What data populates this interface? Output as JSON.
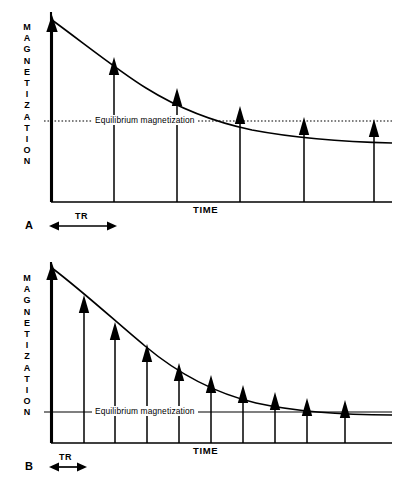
{
  "figure": {
    "panels": [
      {
        "id": "A",
        "letter": "B-wrong-placeholder",
        "axis_y_label": "MAGNETIZATION",
        "axis_x_label": "TIME",
        "equilibrium_label": "Equilibrium  magnetization",
        "tr_label": "TR"
      }
    ]
  },
  "panel_a": {
    "letter": "A",
    "axis_y_label": "MAGNETIZATION",
    "axis_x_label": "TIME",
    "equilibrium_label": "Equilibrium  magnetization",
    "tr_label": "TR"
  },
  "panel_b": {
    "letter": "B",
    "axis_y_label": "MAGNETIZATION",
    "axis_x_label": "TIME",
    "equilibrium_label": "Equilibrium  magnetization",
    "tr_label": "TR"
  },
  "colors": {
    "ink": "#000000",
    "background": "#ffffff",
    "curve": "#000000",
    "equilibrium_line": "#000000"
  },
  "chart_data": [
    {
      "type": "line",
      "panel": "A",
      "title": "",
      "xlabel": "TIME",
      "ylabel": "MAGNETIZATION",
      "xlim": [
        0,
        340
      ],
      "ylim": [
        0,
        182
      ],
      "grid": false,
      "legend": null,
      "annotations": [
        {
          "text": "Equilibrium  magnetization",
          "y": 81,
          "kind": "horizontal-dotted-line"
        },
        {
          "text": "TR",
          "kind": "interval-double-arrow",
          "x_start": 0,
          "x_end": 63
        },
        {
          "text": "A",
          "kind": "panel-letter"
        }
      ],
      "curve": {
        "name": "T1 recovery envelope (long TR)",
        "equation": "M(t) = Meq + (M0 - Meq) * exp(-t / tau)",
        "M0": 182,
        "Meq": 81,
        "tau": 118,
        "x": [
          0,
          20,
          40,
          63,
          85,
          110,
          127,
          150,
          175,
          190,
          220,
          253,
          285,
          317,
          340
        ],
        "y": [
          182,
          167,
          153,
          141,
          130,
          120,
          115,
          108,
          102,
          99,
          94,
          90,
          87,
          85,
          84
        ]
      },
      "pulse_arrows": {
        "name": "Excitation pulses (arrow tips on recovery curve)",
        "count": 6,
        "spacing_tr": 63,
        "x": [
          0,
          63,
          127,
          190,
          253,
          317
        ],
        "tip_y": [
          182,
          141,
          115,
          99,
          90,
          85
        ],
        "base_y": 0
      }
    },
    {
      "type": "line",
      "panel": "B",
      "title": "",
      "xlabel": "TIME",
      "ylabel": "MAGNETIZATION",
      "xlim": [
        0,
        340
      ],
      "ylim": [
        0,
        175
      ],
      "grid": false,
      "legend": null,
      "annotations": [
        {
          "text": "Equilibrium  magnetization",
          "y": 48,
          "kind": "horizontal-solid-line"
        },
        {
          "text": "TR",
          "kind": "interval-double-arrow",
          "x_start": 0,
          "x_end": 32
        },
        {
          "text": "B",
          "kind": "panel-letter"
        }
      ],
      "curve": {
        "name": "T1 recovery envelope (short TR)",
        "equation": "M(t) = Meq + (M0 - Meq) * exp(-t / tau)",
        "M0": 175,
        "Meq": 48,
        "tau": 108,
        "x": [
          0,
          16,
          32,
          48,
          64,
          80,
          96,
          112,
          128,
          144,
          160,
          192,
          224,
          256,
          288,
          320,
          340
        ],
        "y": [
          175,
          158,
          143,
          129,
          117,
          106,
          97,
          88,
          81,
          75,
          70,
          62,
          57,
          53,
          51,
          49,
          49
        ]
      },
      "pulse_arrows": {
        "name": "Excitation pulses (arrow tips on recovery curve)",
        "count": 10,
        "spacing_tr": 32,
        "x": [
          0,
          32,
          64,
          96,
          128,
          160,
          192,
          224,
          256,
          288
        ],
        "tip_y": [
          175,
          143,
          117,
          97,
          81,
          70,
          62,
          57,
          53,
          51
        ],
        "base_y": 0
      }
    }
  ]
}
